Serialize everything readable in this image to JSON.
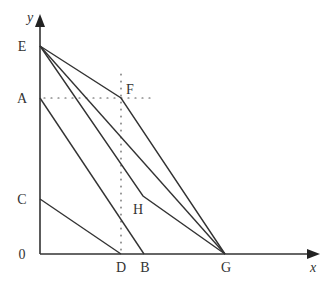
{
  "diagram": {
    "axes": {
      "x_label": "x",
      "y_label": "y",
      "origin_label": "0"
    },
    "points": {
      "E": {
        "label": "E"
      },
      "A": {
        "label": "A"
      },
      "C": {
        "label": "C"
      },
      "F": {
        "label": "F"
      },
      "H": {
        "label": "H"
      },
      "D": {
        "label": "D"
      },
      "B": {
        "label": "B"
      },
      "G": {
        "label": "G"
      }
    },
    "segments": [
      "E-F",
      "F-G",
      "E-G",
      "E-H",
      "H-G",
      "A-B",
      "C-D"
    ],
    "dotted_guides": [
      "A-F horizontal",
      "F-D vertical"
    ],
    "colors": {
      "line": "#333333",
      "text": "#333333",
      "background": "#ffffff"
    }
  }
}
